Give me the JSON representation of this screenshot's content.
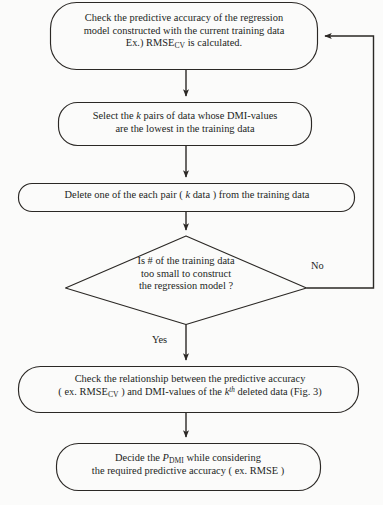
{
  "diagram": {
    "type": "flowchart",
    "background_color": "#fbfbfa",
    "line_color": "#2b2825",
    "text_color": "#231f1d"
  },
  "nodes": {
    "check_accuracy": {
      "id": "n1",
      "shape": "rounded-rectangle",
      "line1": "Check the predictive accuracy of the regression",
      "line2": "model constructed with the current training data",
      "line3_prefix": "Ex.) RMSE",
      "line3_sub": "CV",
      "line3_suffix": " is calculated."
    },
    "select_pairs": {
      "id": "n2",
      "shape": "rounded-rectangle",
      "line1_prefix": "Select the ",
      "line1_italic": "k",
      "line1_suffix": " pairs of data whose DMI-values",
      "line2": "are the lowest in the training data"
    },
    "delete_pair": {
      "id": "n3",
      "shape": "rounded-rectangle",
      "line1_prefix": "Delete one of the each pair ( ",
      "line1_italic": "k",
      "line1_suffix": " data ) from the training data"
    },
    "decision": {
      "id": "n4",
      "shape": "diamond",
      "line1": "Is # of the training data",
      "line2": "too small to construct",
      "line3": "the regression model ?"
    },
    "check_relationship": {
      "id": "n5",
      "shape": "rounded-rectangle",
      "line1": "Check the relationship between the predictive accuracy",
      "line2_prefix": "( ex. RMSE",
      "line2_sub": "CV",
      "line2_mid": " ) and DMI-values of the ",
      "line2_italic": "k",
      "line2_sup": "th",
      "line2_suffix": " deleted data (Fig. 3)"
    },
    "decide_pdmi": {
      "id": "n6",
      "shape": "rounded-rectangle",
      "line1_prefix": "Decide the ",
      "line1_italic": "P",
      "line1_sub": "DMI",
      "line1_suffix": " while considering",
      "line2": "the required predictive accuracy ( ex. RMSE )"
    }
  },
  "edge_labels": {
    "no": "No",
    "yes": "Yes"
  }
}
